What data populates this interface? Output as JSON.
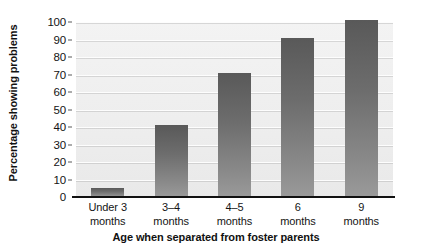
{
  "chart_data": {
    "type": "bar",
    "title": "",
    "xlabel": "Age when separated from foster parents",
    "ylabel": "Percentage showing problems",
    "categories": [
      "Under 3 months",
      "3–4 months",
      "4–5 months",
      "6 months",
      "9 months"
    ],
    "category_lines": [
      {
        "line1": "Under 3",
        "line2": "months"
      },
      {
        "line1": "3–4",
        "line2": "months"
      },
      {
        "line1": "4–5",
        "line2": "months"
      },
      {
        "line1": "6",
        "line2": "months"
      },
      {
        "line1": "9",
        "line2": "months"
      }
    ],
    "values": [
      5,
      41,
      71,
      91,
      101
    ],
    "ylim": [
      0,
      100
    ],
    "ytick_labels": [
      "100",
      "90",
      "80",
      "70",
      "60",
      "50",
      "40",
      "30",
      "20",
      "10",
      "0"
    ],
    "ytick_values": [
      100,
      90,
      80,
      70,
      60,
      50,
      40,
      30,
      20,
      10,
      0
    ],
    "grid": true,
    "legend": "none",
    "bar_color": "#6d6d6d",
    "plot_background": "#eeeeee",
    "gridline_color": "#fdfdfd",
    "axis_color": "#111111"
  }
}
